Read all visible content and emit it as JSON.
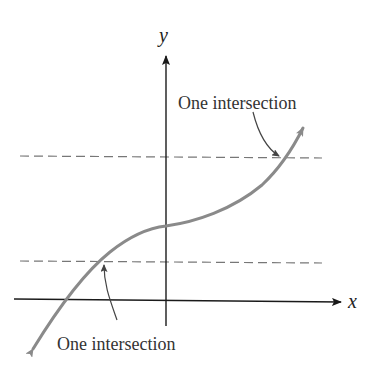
{
  "diagram": {
    "type": "horizontal-line-test",
    "axes": {
      "x_label": "x",
      "y_label": "y"
    },
    "annotations": {
      "upper": "One intersection",
      "lower": "One intersection"
    },
    "colors": {
      "curve": "#8a8a8a",
      "axes": "#1a1a1a",
      "dashed_lines": "#777777",
      "text": "#333333"
    }
  }
}
